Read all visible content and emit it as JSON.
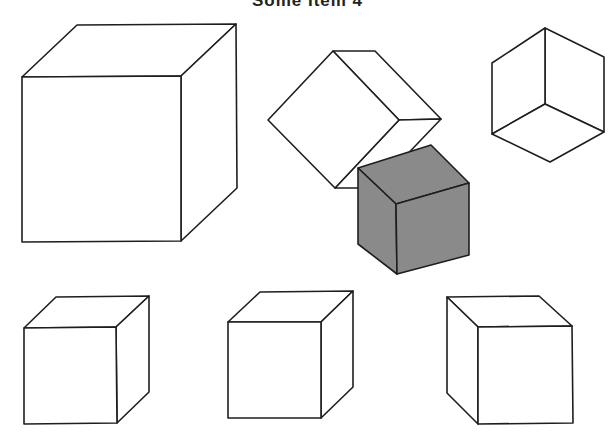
{
  "title": "Some Item 4",
  "figure": {
    "colors": {
      "line": "#1e1e1e",
      "shaded_face": "#8a8a8a",
      "background": "#ffffff"
    },
    "cubes": [
      {
        "id": "large-cube",
        "shaded": false
      },
      {
        "id": "rotated-cube",
        "shaded": false
      },
      {
        "id": "gray-cube",
        "shaded": true
      },
      {
        "id": "below-view-cube",
        "shaded": false
      },
      {
        "id": "option-cube-a",
        "shaded": false
      },
      {
        "id": "option-cube-b",
        "shaded": false
      },
      {
        "id": "option-cube-c",
        "shaded": false
      }
    ]
  }
}
